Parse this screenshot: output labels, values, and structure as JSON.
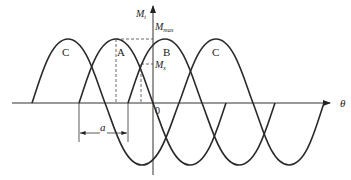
{
  "diagram": {
    "axes": {
      "y_label": "M",
      "y_label_sub": "t",
      "x_label": "θ",
      "origin_label": "0"
    },
    "annotations": {
      "m_max": "M",
      "m_max_sub": "max",
      "m_x": "M",
      "m_x_sub": "x",
      "dimension": "a"
    },
    "curves": [
      {
        "name": "C",
        "label": "C",
        "peak_x": 68
      },
      {
        "name": "A",
        "label": "A",
        "peak_x": 116
      },
      {
        "name": "B",
        "label": "B",
        "peak_x": 165
      },
      {
        "name": "C-right",
        "label": "C",
        "peak_x": 216
      }
    ],
    "colors": {
      "line": "#2a2a2a",
      "background": "#ffffff"
    }
  }
}
